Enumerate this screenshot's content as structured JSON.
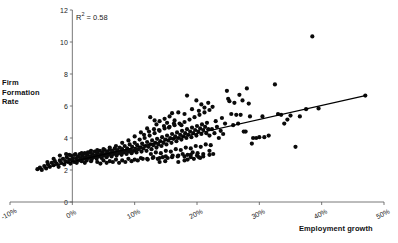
{
  "chart_data": {
    "type": "scatter",
    "title": "",
    "xlabel": "Employment growth",
    "ylabel": "Firm Formation Rate",
    "ylabel_lines": [
      "Firm",
      "Formation",
      "Rate"
    ],
    "annotation": "R2 = 0.58",
    "annotation_symbol": "R",
    "annotation_sup": "2",
    "annotation_rest": " = 0.58",
    "r_squared": 0.58,
    "grid": false,
    "legend": "none",
    "xlim": [
      -10,
      50
    ],
    "ylim": [
      0,
      12
    ],
    "xticks": [
      -10,
      0,
      10,
      20,
      30,
      40,
      50
    ],
    "xtick_labels": [
      "-10%",
      "0%",
      "10%",
      "20%",
      "30%",
      "40%",
      "50%"
    ],
    "yticks": [
      0,
      2,
      4,
      6,
      8,
      10,
      12
    ],
    "ytick_labels": [
      "0",
      "2",
      "4",
      "6",
      "8",
      "10",
      "12"
    ],
    "trendline": {
      "x0": -5.5,
      "y0": 2.05,
      "x1": 47.0,
      "y1": 6.65
    },
    "points": [
      [
        -5.6,
        2.05
      ],
      [
        -5.2,
        2.15
      ],
      [
        -4.9,
        2.0
      ],
      [
        -4.5,
        2.25
      ],
      [
        -4.2,
        2.1
      ],
      [
        -3.9,
        2.35
      ],
      [
        -3.6,
        2.2
      ],
      [
        -3.3,
        2.45
      ],
      [
        -3.0,
        2.3
      ],
      [
        -2.8,
        2.55
      ],
      [
        -2.5,
        2.4
      ],
      [
        -2.2,
        2.2
      ],
      [
        -2.0,
        2.6
      ],
      [
        -1.8,
        2.45
      ],
      [
        -1.5,
        2.7
      ],
      [
        -1.3,
        2.35
      ],
      [
        -1.1,
        2.55
      ],
      [
        -0.9,
        2.8
      ],
      [
        -0.7,
        2.5
      ],
      [
        -0.5,
        2.65
      ],
      [
        -0.3,
        2.4
      ],
      [
        -0.2,
        2.9
      ],
      [
        0.0,
        2.6
      ],
      [
        0.1,
        2.75
      ],
      [
        0.3,
        2.5
      ],
      [
        0.4,
        2.95
      ],
      [
        0.6,
        2.7
      ],
      [
        0.7,
        2.45
      ],
      [
        0.9,
        2.85
      ],
      [
        1.0,
        2.6
      ],
      [
        1.2,
        3.0
      ],
      [
        1.3,
        2.75
      ],
      [
        1.5,
        2.55
      ],
      [
        1.6,
        2.9
      ],
      [
        1.8,
        2.7
      ],
      [
        2.0,
        3.05
      ],
      [
        2.1,
        2.8
      ],
      [
        2.3,
        2.6
      ],
      [
        2.4,
        2.95
      ],
      [
        2.6,
        2.75
      ],
      [
        2.8,
        3.1
      ],
      [
        2.9,
        2.85
      ],
      [
        3.1,
        2.65
      ],
      [
        3.2,
        3.0
      ],
      [
        3.4,
        2.8
      ],
      [
        3.6,
        3.15
      ],
      [
        3.7,
        2.9
      ],
      [
        3.9,
        2.7
      ],
      [
        4.0,
        3.05
      ],
      [
        4.2,
        2.85
      ],
      [
        4.4,
        3.2
      ],
      [
        4.5,
        2.95
      ],
      [
        4.7,
        2.75
      ],
      [
        4.8,
        3.1
      ],
      [
        5.0,
        2.9
      ],
      [
        5.2,
        3.25
      ],
      [
        5.3,
        3.0
      ],
      [
        5.5,
        2.8
      ],
      [
        5.6,
        3.15
      ],
      [
        5.8,
        2.95
      ],
      [
        6.0,
        3.3
      ],
      [
        6.1,
        3.05
      ],
      [
        6.3,
        2.85
      ],
      [
        6.4,
        3.2
      ],
      [
        6.6,
        3.0
      ],
      [
        6.8,
        3.35
      ],
      [
        6.9,
        3.1
      ],
      [
        7.1,
        2.9
      ],
      [
        7.2,
        3.25
      ],
      [
        7.4,
        3.05
      ],
      [
        7.6,
        3.4
      ],
      [
        7.7,
        3.15
      ],
      [
        7.9,
        2.95
      ],
      [
        8.0,
        3.3
      ],
      [
        8.2,
        3.1
      ],
      [
        8.4,
        3.5
      ],
      [
        8.5,
        3.2
      ],
      [
        8.7,
        3.0
      ],
      [
        8.8,
        3.35
      ],
      [
        9.0,
        3.15
      ],
      [
        9.2,
        3.6
      ],
      [
        9.3,
        3.25
      ],
      [
        9.5,
        3.05
      ],
      [
        9.6,
        3.45
      ],
      [
        9.8,
        3.2
      ],
      [
        10.0,
        3.7
      ],
      [
        10.1,
        3.3
      ],
      [
        10.3,
        3.1
      ],
      [
        10.4,
        3.55
      ],
      [
        10.6,
        3.3
      ],
      [
        10.8,
        3.9
      ],
      [
        10.9,
        3.4
      ],
      [
        11.1,
        3.15
      ],
      [
        11.2,
        3.65
      ],
      [
        11.4,
        3.35
      ],
      [
        11.6,
        4.0
      ],
      [
        11.7,
        3.5
      ],
      [
        11.9,
        3.2
      ],
      [
        12.0,
        3.75
      ],
      [
        12.2,
        3.45
      ],
      [
        12.4,
        4.15
      ],
      [
        12.5,
        3.6
      ],
      [
        12.7,
        3.3
      ],
      [
        12.8,
        3.85
      ],
      [
        13.0,
        3.55
      ],
      [
        13.2,
        4.3
      ],
      [
        13.3,
        3.7
      ],
      [
        13.5,
        3.4
      ],
      [
        13.6,
        3.95
      ],
      [
        13.8,
        3.6
      ],
      [
        14.0,
        4.45
      ],
      [
        14.1,
        3.8
      ],
      [
        14.3,
        3.5
      ],
      [
        14.4,
        4.05
      ],
      [
        14.6,
        3.7
      ],
      [
        14.8,
        4.6
      ],
      [
        14.9,
        3.9
      ],
      [
        15.1,
        3.6
      ],
      [
        15.2,
        4.15
      ],
      [
        15.4,
        3.85
      ],
      [
        15.6,
        4.7
      ],
      [
        15.7,
        4.0
      ],
      [
        15.9,
        3.7
      ],
      [
        16.0,
        4.25
      ],
      [
        16.2,
        3.95
      ],
      [
        16.4,
        4.8
      ],
      [
        16.5,
        4.1
      ],
      [
        16.7,
        3.8
      ],
      [
        16.8,
        4.35
      ],
      [
        17.0,
        4.0
      ],
      [
        17.2,
        4.9
      ],
      [
        17.3,
        4.2
      ],
      [
        17.5,
        3.9
      ],
      [
        17.6,
        4.45
      ],
      [
        17.8,
        4.1
      ],
      [
        18.0,
        5.0
      ],
      [
        18.1,
        4.3
      ],
      [
        18.3,
        4.0
      ],
      [
        18.4,
        4.55
      ],
      [
        18.6,
        4.2
      ],
      [
        18.8,
        5.15
      ],
      [
        18.9,
        4.4
      ],
      [
        19.1,
        4.05
      ],
      [
        19.2,
        4.65
      ],
      [
        19.4,
        4.3
      ],
      [
        19.6,
        5.3
      ],
      [
        19.7,
        4.5
      ],
      [
        19.9,
        4.15
      ],
      [
        20.0,
        4.75
      ],
      [
        20.2,
        4.4
      ],
      [
        20.4,
        5.45
      ],
      [
        20.5,
        4.6
      ],
      [
        20.7,
        4.25
      ],
      [
        20.8,
        4.85
      ],
      [
        21.0,
        4.5
      ],
      [
        21.2,
        5.6
      ],
      [
        21.3,
        4.7
      ],
      [
        21.5,
        4.3
      ],
      [
        21.6,
        4.95
      ],
      [
        21.8,
        4.55
      ],
      [
        22.0,
        5.75
      ],
      [
        2.0,
        2.45
      ],
      [
        3.0,
        2.55
      ],
      [
        4.0,
        2.5
      ],
      [
        5.0,
        2.6
      ],
      [
        6.0,
        2.55
      ],
      [
        7.0,
        2.65
      ],
      [
        8.0,
        2.6
      ],
      [
        9.0,
        2.7
      ],
      [
        10.0,
        2.65
      ],
      [
        11.0,
        2.75
      ],
      [
        12.0,
        2.7
      ],
      [
        13.0,
        2.8
      ],
      [
        14.0,
        2.75
      ],
      [
        15.0,
        2.85
      ],
      [
        16.0,
        2.8
      ],
      [
        17.0,
        2.9
      ],
      [
        18.0,
        2.85
      ],
      [
        19.0,
        2.95
      ],
      [
        20.0,
        2.9
      ],
      [
        21.0,
        3.0
      ],
      [
        22.0,
        2.95
      ],
      [
        11.5,
        4.2
      ],
      [
        12.3,
        4.4
      ],
      [
        13.1,
        4.55
      ],
      [
        13.9,
        4.5
      ],
      [
        14.7,
        4.75
      ],
      [
        15.5,
        4.65
      ],
      [
        16.3,
        4.9
      ],
      [
        12.6,
        3.0
      ],
      [
        13.4,
        3.1
      ],
      [
        14.2,
        3.05
      ],
      [
        15.0,
        3.2
      ],
      [
        15.8,
        3.15
      ],
      [
        16.6,
        3.3
      ],
      [
        17.4,
        3.25
      ],
      [
        18.2,
        3.4
      ],
      [
        19.0,
        3.35
      ],
      [
        19.8,
        3.5
      ],
      [
        20.6,
        3.45
      ],
      [
        21.4,
        3.6
      ],
      [
        22.2,
        3.55
      ],
      [
        10.5,
        2.6
      ],
      [
        11.3,
        2.7
      ],
      [
        12.1,
        2.65
      ],
      [
        12.9,
        2.75
      ],
      [
        13.7,
        2.7
      ],
      [
        14.5,
        2.8
      ],
      [
        15.3,
        2.75
      ],
      [
        16.1,
        2.9
      ],
      [
        16.9,
        2.85
      ],
      [
        17.7,
        3.0
      ],
      [
        18.5,
        2.95
      ],
      [
        19.3,
        3.1
      ],
      [
        20.1,
        3.05
      ],
      [
        14.0,
        2.5
      ],
      [
        14.9,
        2.55
      ],
      [
        17.0,
        2.5
      ],
      [
        18.0,
        2.6
      ],
      [
        19.5,
        2.7
      ],
      [
        20.3,
        2.8
      ],
      [
        12.5,
        5.3
      ],
      [
        13.2,
        5.1
      ],
      [
        14.0,
        5.05
      ],
      [
        14.8,
        5.2
      ],
      [
        15.6,
        5.35
      ],
      [
        16.4,
        5.1
      ],
      [
        17.0,
        5.6
      ],
      [
        18.0,
        5.5
      ],
      [
        18.4,
        6.65
      ],
      [
        19.2,
        5.8
      ],
      [
        19.9,
        6.35
      ],
      [
        20.3,
        5.7
      ],
      [
        20.7,
        6.1
      ],
      [
        21.2,
        5.9
      ],
      [
        21.8,
        6.2
      ],
      [
        22.5,
        5.95
      ],
      [
        22.0,
        4.15
      ],
      [
        22.4,
        4.55
      ],
      [
        22.8,
        4.3
      ],
      [
        23.0,
        5.05
      ],
      [
        23.2,
        4.7
      ],
      [
        23.5,
        4.0
      ],
      [
        23.8,
        4.45
      ],
      [
        24.0,
        5.25
      ],
      [
        24.2,
        4.25
      ],
      [
        24.5,
        4.9
      ],
      [
        24.8,
        6.95
      ],
      [
        25.0,
        6.45
      ],
      [
        25.2,
        6.3
      ],
      [
        25.5,
        5.5
      ],
      [
        25.8,
        4.8
      ],
      [
        26.0,
        6.2
      ],
      [
        26.3,
        5.45
      ],
      [
        26.6,
        4.9
      ],
      [
        26.8,
        6.7
      ],
      [
        27.0,
        5.45
      ],
      [
        27.3,
        6.35
      ],
      [
        27.5,
        4.4
      ],
      [
        27.8,
        4.4
      ],
      [
        28.0,
        7.1
      ],
      [
        28.3,
        6.15
      ],
      [
        28.5,
        5.35
      ],
      [
        28.8,
        3.65
      ],
      [
        29.0,
        4.0
      ],
      [
        29.5,
        4.0
      ],
      [
        30.0,
        4.05
      ],
      [
        30.5,
        5.35
      ],
      [
        30.8,
        4.05
      ],
      [
        31.5,
        4.15
      ],
      [
        32.5,
        7.35
      ],
      [
        33.0,
        5.5
      ],
      [
        33.5,
        5.45
      ],
      [
        34.0,
        4.9
      ],
      [
        34.5,
        5.15
      ],
      [
        35.0,
        5.4
      ],
      [
        35.8,
        3.45
      ],
      [
        36.5,
        5.35
      ],
      [
        37.5,
        5.8
      ],
      [
        38.5,
        10.35
      ],
      [
        39.5,
        5.85
      ],
      [
        47.0,
        6.65
      ],
      [
        20.5,
        2.75
      ],
      [
        21.0,
        2.85
      ],
      [
        19.0,
        2.8
      ],
      [
        18.5,
        2.65
      ],
      [
        22.0,
        3.2
      ],
      [
        22.6,
        3.0
      ],
      [
        8.5,
        2.5
      ],
      [
        9.5,
        2.55
      ],
      [
        7.5,
        2.45
      ],
      [
        6.5,
        2.5
      ],
      [
        5.5,
        2.45
      ],
      [
        4.5,
        2.4
      ],
      [
        16.0,
        5.55
      ],
      [
        17.5,
        4.8
      ],
      [
        15.2,
        4.95
      ],
      [
        13.5,
        4.85
      ],
      [
        12.0,
        4.6
      ],
      [
        11.0,
        4.35
      ],
      [
        10.0,
        4.1
      ],
      [
        9.0,
        3.85
      ],
      [
        8.0,
        3.7
      ],
      [
        7.0,
        3.5
      ],
      [
        6.0,
        3.4
      ],
      [
        5.0,
        3.3
      ],
      [
        4.0,
        3.25
      ],
      [
        3.0,
        3.2
      ],
      [
        2.5,
        3.1
      ],
      [
        1.5,
        3.05
      ],
      [
        0.5,
        3.0
      ],
      [
        -0.5,
        2.95
      ],
      [
        -1.0,
        3.0
      ],
      [
        -2.0,
        2.9
      ],
      [
        -3.0,
        2.7
      ],
      [
        -4.0,
        2.5
      ]
    ]
  }
}
